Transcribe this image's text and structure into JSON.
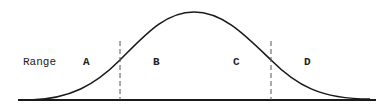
{
  "diagram": {
    "axis_label": "Range",
    "regions": [
      {
        "label": "A"
      },
      {
        "label": "B"
      },
      {
        "label": "C"
      },
      {
        "label": "D"
      }
    ],
    "colors": {
      "curve": "#1a1a1a",
      "baseline": "#1a1a1a",
      "divider": "#555555",
      "text": "#222222"
    }
  }
}
